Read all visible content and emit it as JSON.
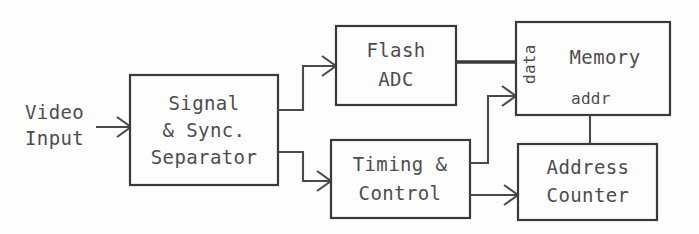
{
  "diagram": {
    "background_color": "#fdfdfd",
    "line_color": "#4a4a4a",
    "text_color": "#4d4d4d",
    "external_inputs": [
      {
        "id": "video-input",
        "line1": "Video",
        "line2": "Input"
      }
    ],
    "blocks": [
      {
        "id": "signal-sync-separator",
        "lines": [
          "Signal",
          "& Sync.",
          "Separator"
        ],
        "x": 130,
        "y": 75,
        "w": 148,
        "h": 110
      },
      {
        "id": "flash-adc",
        "lines": [
          "Flash",
          "ADC"
        ],
        "x": 336,
        "y": 26,
        "w": 120,
        "h": 79
      },
      {
        "id": "timing-control",
        "lines": [
          "Timing &",
          "Control"
        ],
        "x": 331,
        "y": 140,
        "w": 139,
        "h": 78
      },
      {
        "id": "memory",
        "lines": [
          "Memory"
        ],
        "x": 516,
        "y": 22,
        "w": 154,
        "h": 93,
        "port_labels": [
          {
            "id": "memory-port-data",
            "text": "data",
            "orientation": "vertical"
          },
          {
            "id": "memory-port-addr",
            "text": "addr",
            "orientation": "horizontal"
          }
        ]
      },
      {
        "id": "address-counter",
        "lines": [
          "Address",
          "Counter"
        ],
        "x": 518,
        "y": 144,
        "w": 139,
        "h": 76
      }
    ],
    "connections": [
      {
        "id": "video-to-separator",
        "from": "video-input",
        "to": "signal-sync-separator",
        "kind": "signal",
        "arrow": true
      },
      {
        "id": "separator-to-flash-adc",
        "from": "signal-sync-separator",
        "to": "flash-adc",
        "kind": "signal",
        "arrow": true
      },
      {
        "id": "separator-to-timing-control",
        "from": "signal-sync-separator",
        "to": "timing-control",
        "kind": "signal",
        "arrow": true
      },
      {
        "id": "flash-adc-to-memory-data",
        "from": "flash-adc",
        "to": "memory",
        "kind": "bus",
        "arrow": false
      },
      {
        "id": "timing-control-to-memory-addr",
        "from": "timing-control",
        "to": "memory",
        "kind": "signal",
        "arrow": true
      },
      {
        "id": "timing-control-to-address-counter",
        "from": "timing-control",
        "to": "address-counter",
        "kind": "signal",
        "arrow": true
      },
      {
        "id": "address-counter-to-memory",
        "from": "address-counter",
        "to": "memory",
        "kind": "signal",
        "arrow": false
      }
    ]
  }
}
